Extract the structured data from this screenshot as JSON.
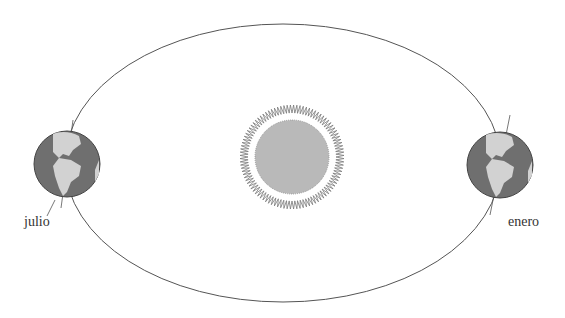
{
  "diagram": {
    "labels": {
      "july": "julio",
      "january": "enero"
    },
    "colors": {
      "orbit": "#555555",
      "sun_core": "#b9b9b9",
      "corona": "#777777",
      "ocean": "#6f6f6f",
      "land": "#d2d2d2"
    }
  }
}
